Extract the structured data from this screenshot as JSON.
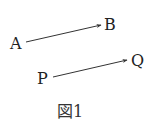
{
  "figure": {
    "caption": "図1",
    "points": {
      "A": {
        "label": "A"
      },
      "B": {
        "label": "B"
      },
      "P": {
        "label": "P"
      },
      "Q": {
        "label": "Q"
      }
    },
    "vectors": [
      {
        "from": "A",
        "to": "B"
      },
      {
        "from": "P",
        "to": "Q"
      }
    ],
    "colors": {
      "stroke": "#333333",
      "text": "#222222"
    }
  }
}
